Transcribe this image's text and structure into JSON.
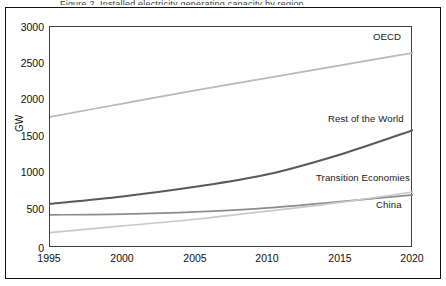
{
  "figure": {
    "top_caption_fragment": "Figure 2.  Installed electricity generating capacity by region",
    "background_color": "#ffffff",
    "frame_color": "#111111"
  },
  "axes": {
    "ylabel": "GW",
    "yticks": [
      "0",
      "500",
      "1000",
      "1500",
      "2000",
      "2500",
      "3000"
    ],
    "xticks": [
      "1995",
      "2000",
      "2005",
      "2010",
      "2015",
      "2020"
    ]
  },
  "series_labels": {
    "oecd": "OECD",
    "rest_of_world": "Rest of the World",
    "transition_economies": "Transition Economies",
    "china": "China"
  },
  "colors": {
    "oecd": "#b9b9b9",
    "rest_of_world": "#5a5a5a",
    "transition_economies": "#8c8c8c",
    "china": "#c9c9c9",
    "axis": "#3f3f3f",
    "text": "#111111"
  },
  "chart_data": {
    "type": "line",
    "title": "Installed electricity generating capacity by region",
    "xlabel": "",
    "ylabel": "GW",
    "xlim": [
      1995,
      2020
    ],
    "ylim": [
      0,
      3000
    ],
    "ytick_step": 500,
    "xtick_step": 5,
    "grid": false,
    "legend": "inline-labels",
    "x": [
      1995,
      2000,
      2005,
      2010,
      2015,
      2020
    ],
    "series": [
      {
        "name": "OECD",
        "color": "#b9b9b9",
        "label_position": "top-right",
        "values": [
          1780,
          1960,
          2140,
          2310,
          2480,
          2650
        ]
      },
      {
        "name": "Rest of the World",
        "color": "#5a5a5a",
        "label_position": "right-upper-middle",
        "values": [
          600,
          700,
          830,
          1000,
          1270,
          1600
        ]
      },
      {
        "name": "Transition Economies",
        "color": "#8c8c8c",
        "label_position": "right-lower-middle",
        "values": [
          450,
          460,
          490,
          545,
          630,
          720
        ]
      },
      {
        "name": "China",
        "color": "#c9c9c9",
        "label_position": "right-bottom",
        "values": [
          210,
          300,
          390,
          500,
          620,
          760
        ]
      }
    ]
  }
}
